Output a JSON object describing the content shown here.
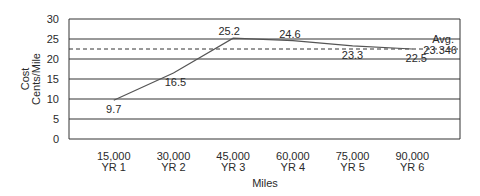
{
  "chart_data": {
    "type": "line",
    "title": "",
    "xlabel": "Miles",
    "ylabel_lines": [
      "Cost",
      "Cents/Mile"
    ],
    "ylabel": "Cost Cents/Mile",
    "ylim": [
      0,
      30
    ],
    "yticks": [
      0,
      5,
      10,
      15,
      20,
      25,
      30
    ],
    "grid": true,
    "legend": "none",
    "categories": [
      {
        "miles": "15,000",
        "year": "YR 1"
      },
      {
        "miles": "30,000",
        "year": "YR 2"
      },
      {
        "miles": "45,000",
        "year": "YR 3"
      },
      {
        "miles": "60,000",
        "year": "YR 4"
      },
      {
        "miles": "75,000",
        "year": "YR 5"
      },
      {
        "miles": "90,000",
        "year": "YR 6"
      }
    ],
    "series": [
      {
        "name": "Cost per mile",
        "values": [
          9.7,
          16.5,
          25.2,
          24.6,
          23.3,
          22.5
        ],
        "labels": [
          "9.7",
          "16.5",
          "25.2",
          "24.6",
          "23.3",
          "22.5"
        ]
      }
    ],
    "reference_line": {
      "name": "Avg.",
      "value": 22.5,
      "label": "Avg.",
      "value_label": "23.346",
      "style": "dashed"
    }
  },
  "colors": {
    "line": "#555555",
    "grid": "#333333",
    "text": "#2a2a2a"
  }
}
